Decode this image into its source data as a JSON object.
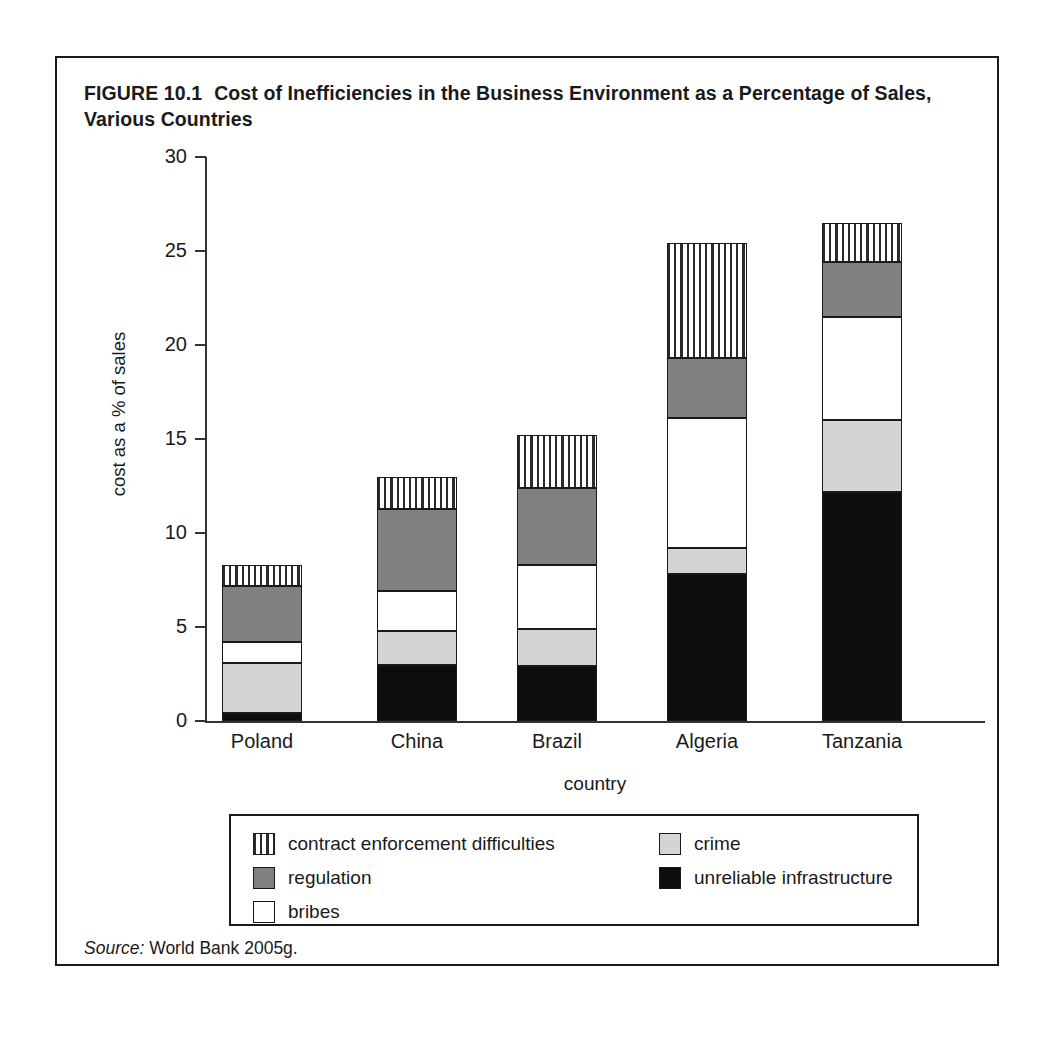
{
  "figure": {
    "number": "FIGURE 10.1",
    "title": "Cost of Inefficiencies in the Business Environment as a Percentage of Sales, Various Countries",
    "source_label": "Source:",
    "source_text": "World Bank 2005g."
  },
  "chart_data": {
    "type": "bar",
    "subtype": "stacked-bar",
    "title": "Cost of Inefficiencies in the Business Environment as a Percentage of Sales, Various Countries",
    "xlabel": "country",
    "ylabel": "cost as a % of sales",
    "categories": [
      "Poland",
      "China",
      "Brazil",
      "Algeria",
      "Tanzania"
    ],
    "ylim": [
      0,
      30
    ],
    "yticks": [
      0,
      5,
      10,
      15,
      20,
      25,
      30
    ],
    "ytick_labels": [
      "0",
      "5",
      "10",
      "15",
      "20",
      "25",
      "30"
    ],
    "grid": false,
    "legend_position": "below-plot",
    "stack_order_bottom_to_top": [
      "unreliable infrastructure",
      "crime",
      "bribes",
      "regulation",
      "contract enforcement difficulties"
    ],
    "series": [
      {
        "name": "unreliable infrastructure",
        "key": "infra",
        "fill": "solid-black",
        "color": "#0d0d0d",
        "values": [
          0.4,
          3.0,
          2.9,
          7.8,
          12.2
        ]
      },
      {
        "name": "crime",
        "key": "crime",
        "fill": "light-gray",
        "color": "#d4d4d4",
        "values": [
          2.7,
          1.8,
          2.0,
          1.4,
          3.8
        ]
      },
      {
        "name": "bribes",
        "key": "bribes",
        "fill": "white",
        "color": "#ffffff",
        "values": [
          1.1,
          2.1,
          3.4,
          6.9,
          5.5
        ]
      },
      {
        "name": "regulation",
        "key": "regulation",
        "fill": "medium-gray",
        "color": "#808080",
        "values": [
          3.0,
          4.4,
          4.1,
          3.2,
          2.9
        ]
      },
      {
        "name": "contract enforcement difficulties",
        "key": "contract",
        "fill": "vertical-hatch",
        "color": "#ffffff",
        "values": [
          1.1,
          1.7,
          2.8,
          6.1,
          2.1
        ]
      }
    ],
    "totals": [
      8.3,
      13.0,
      15.2,
      25.4,
      26.5
    ]
  },
  "legend": {
    "left_column": [
      {
        "label": "contract enforcement difficulties",
        "swatch": "vertical-hatch"
      },
      {
        "label": "regulation",
        "swatch": "medium-gray"
      },
      {
        "label": "bribes",
        "swatch": "white"
      }
    ],
    "right_column": [
      {
        "label": "crime",
        "swatch": "light-gray"
      },
      {
        "label": "unreliable infrastructure",
        "swatch": "solid-black"
      }
    ]
  }
}
